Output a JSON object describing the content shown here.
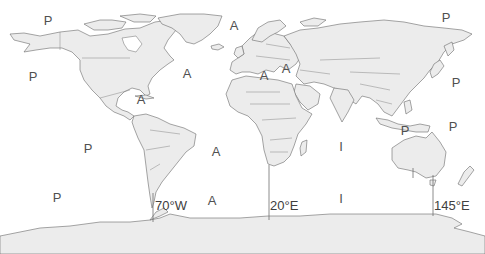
{
  "map": {
    "projection": "world outline map",
    "ocean_labels": [
      {
        "text": "P",
        "ocean": "Pacific",
        "x": 48,
        "y": 20
      },
      {
        "text": "A",
        "ocean": "Atlantic",
        "x": 234,
        "y": 25
      },
      {
        "text": "P",
        "ocean": "Pacific",
        "x": 446,
        "y": 17
      },
      {
        "text": "P",
        "ocean": "Pacific",
        "x": 33,
        "y": 76
      },
      {
        "text": "A",
        "ocean": "Atlantic",
        "x": 187,
        "y": 73
      },
      {
        "text": "A",
        "ocean": "Mediterranean/Atlantic",
        "x": 264,
        "y": 75
      },
      {
        "text": "A",
        "ocean": "Black Sea/Atlantic",
        "x": 286,
        "y": 68
      },
      {
        "text": "P",
        "ocean": "Pacific",
        "x": 456,
        "y": 82
      },
      {
        "text": "A",
        "ocean": "Caribbean/Atlantic",
        "x": 141,
        "y": 99
      },
      {
        "text": "P",
        "ocean": "Pacific",
        "x": 88,
        "y": 148
      },
      {
        "text": "A",
        "ocean": "Atlantic",
        "x": 216,
        "y": 151
      },
      {
        "text": "I",
        "ocean": "Indian",
        "x": 341,
        "y": 146
      },
      {
        "text": "P",
        "ocean": "Pacific",
        "x": 405,
        "y": 130
      },
      {
        "text": "P",
        "ocean": "Pacific",
        "x": 453,
        "y": 126
      },
      {
        "text": "P",
        "ocean": "Pacific",
        "x": 57,
        "y": 197
      },
      {
        "text": "A",
        "ocean": "Atlantic",
        "x": 212,
        "y": 200
      },
      {
        "text": "I",
        "ocean": "Indian",
        "x": 341,
        "y": 198
      }
    ],
    "meridians": [
      {
        "label": "70°W",
        "x": 153,
        "y_top": 193,
        "y_bottom": 222,
        "label_x": 155,
        "label_y": 199
      },
      {
        "label": "20°E",
        "x": 269,
        "y_top": 165,
        "y_bottom": 220,
        "label_x": 270,
        "label_y": 199
      },
      {
        "label": "145°E",
        "x": 433,
        "y_top": 175,
        "y_bottom": 216,
        "label_x": 434,
        "label_y": 199
      }
    ],
    "colors": {
      "land_fill": "#ececec",
      "outline": "#6a6a6a",
      "background": "#ffffff",
      "label": "#505050"
    }
  }
}
